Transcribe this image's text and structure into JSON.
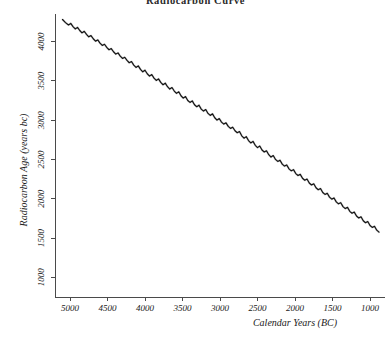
{
  "chart_data": {
    "type": "line",
    "title": "Radiocarbon Curve",
    "xlabel": "Calendar Years (BC)",
    "ylabel": "Radiocarbon Age (years bc)",
    "grid": false,
    "legend": "none",
    "x_axis_reversed": true,
    "xlim": [
      5200,
      800
    ],
    "ylim": [
      750,
      4350
    ],
    "x_ticks": [
      5000,
      4500,
      4000,
      3500,
      3000,
      2500,
      2000,
      1500,
      1000
    ],
    "x_tick_labels": [
      "5000",
      "4500",
      "4000",
      "3500",
      "3000",
      "2500",
      "2000",
      "1500",
      "1000"
    ],
    "y_ticks": [
      1000,
      1500,
      2000,
      2500,
      3000,
      3500,
      4000
    ],
    "y_tick_labels": [
      "1000",
      "1500",
      "2000",
      "2500",
      "3000",
      "3500",
      "4000"
    ],
    "series": [
      {
        "name": "Calibration curve",
        "color": "#111111",
        "x": [
          5100,
          5060,
          5020,
          4990,
          4960,
          4930,
          4900,
          4870,
          4840,
          4810,
          4780,
          4750,
          4720,
          4690,
          4660,
          4630,
          4600,
          4570,
          4540,
          4510,
          4480,
          4450,
          4420,
          4390,
          4360,
          4330,
          4300,
          4270,
          4240,
          4210,
          4180,
          4150,
          4120,
          4090,
          4060,
          4030,
          4000,
          3970,
          3940,
          3910,
          3880,
          3850,
          3820,
          3790,
          3760,
          3730,
          3700,
          3670,
          3640,
          3610,
          3580,
          3550,
          3520,
          3490,
          3460,
          3430,
          3400,
          3370,
          3340,
          3310,
          3280,
          3250,
          3220,
          3190,
          3160,
          3130,
          3100,
          3070,
          3040,
          3010,
          2980,
          2950,
          2920,
          2890,
          2860,
          2830,
          2800,
          2770,
          2740,
          2710,
          2680,
          2650,
          2620,
          2590,
          2560,
          2530,
          2500,
          2470,
          2440,
          2410,
          2380,
          2350,
          2320,
          2290,
          2260,
          2230,
          2200,
          2170,
          2140,
          2110,
          2080,
          2050,
          2020,
          1990,
          1960,
          1930,
          1900,
          1870,
          1840,
          1810,
          1780,
          1750,
          1720,
          1690,
          1660,
          1630,
          1600,
          1570,
          1540,
          1510,
          1480,
          1450,
          1420,
          1390,
          1360,
          1330,
          1300,
          1270,
          1240,
          1210,
          1180,
          1150,
          1120,
          1090,
          1060,
          1030,
          1000,
          970,
          940,
          910,
          880
        ],
        "y": [
          4280,
          4240,
          4210,
          4230,
          4190,
          4160,
          4180,
          4140,
          4110,
          4130,
          4090,
          4060,
          4075,
          4035,
          4005,
          4020,
          3980,
          3950,
          3965,
          3925,
          3895,
          3910,
          3870,
          3840,
          3855,
          3815,
          3785,
          3800,
          3760,
          3730,
          3745,
          3700,
          3670,
          3690,
          3645,
          3615,
          3635,
          3590,
          3560,
          3580,
          3535,
          3505,
          3525,
          3480,
          3450,
          3470,
          3425,
          3395,
          3415,
          3370,
          3340,
          3360,
          3310,
          3280,
          3300,
          3250,
          3225,
          3245,
          3195,
          3170,
          3190,
          3140,
          3115,
          3135,
          3085,
          3060,
          3080,
          3030,
          3000,
          3020,
          2975,
          2950,
          2965,
          2920,
          2895,
          2910,
          2865,
          2840,
          2855,
          2800,
          2770,
          2790,
          2740,
          2710,
          2730,
          2680,
          2650,
          2670,
          2620,
          2595,
          2610,
          2560,
          2530,
          2550,
          2500,
          2475,
          2490,
          2440,
          2415,
          2430,
          2380,
          2355,
          2370,
          2320,
          2295,
          2310,
          2260,
          2235,
          2250,
          2200,
          2175,
          2190,
          2140,
          2115,
          2130,
          2080,
          2055,
          2070,
          2020,
          1995,
          2010,
          1960,
          1935,
          1950,
          1900,
          1875,
          1890,
          1840,
          1815,
          1830,
          1780,
          1755,
          1770,
          1720,
          1695,
          1710,
          1660,
          1635,
          1650,
          1600,
          1575
        ]
      }
    ]
  }
}
